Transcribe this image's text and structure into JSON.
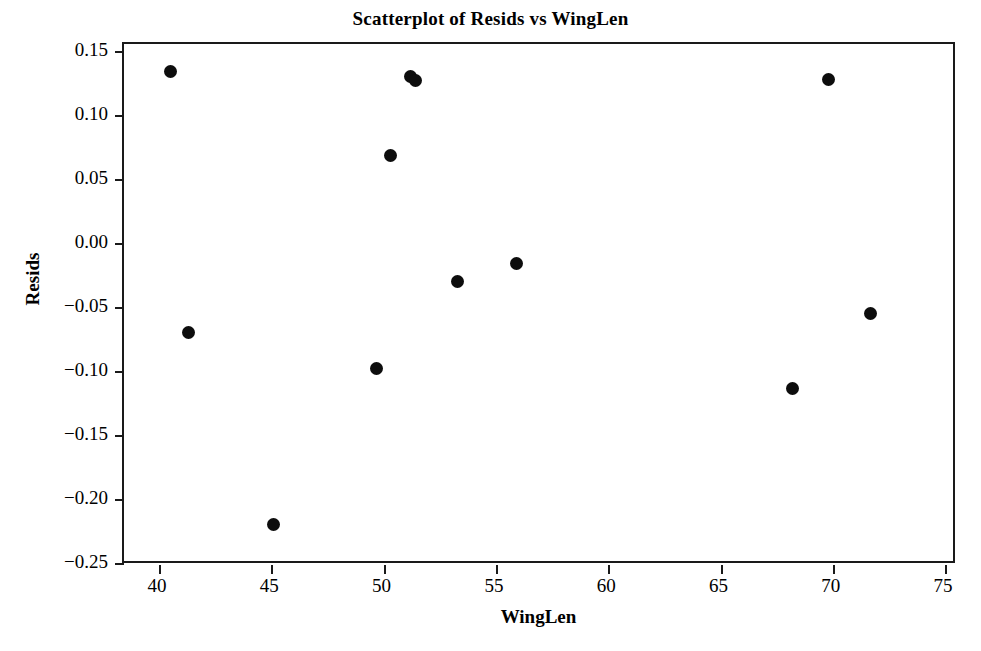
{
  "chart_data": {
    "type": "scatter",
    "title": "Scatterplot of Resids vs WingLen",
    "xlabel": "WingLen",
    "ylabel": "Resids",
    "xlim": [
      38.44,
      75.53
    ],
    "ylim": [
      -0.2516,
      0.1555
    ],
    "xticks": [
      40,
      45,
      50,
      55,
      60,
      65,
      70,
      75
    ],
    "xtick_labels": [
      "40",
      "45",
      "50",
      "55",
      "60",
      "65",
      "70",
      "75"
    ],
    "yticks": [
      0.15,
      0.1,
      0.05,
      0.0,
      -0.05,
      -0.1,
      -0.15,
      -0.2,
      -0.25
    ],
    "ytick_labels": [
      "0.15",
      "0.10",
      "0.05",
      "0.00",
      "−0.05",
      "−0.10",
      "−0.15",
      "−0.20",
      "−0.25"
    ],
    "grid": false,
    "legend": null,
    "marker": "filled-circle",
    "marker_color": "#0d0d0d",
    "frame_color": "#1a1a1a",
    "background": "#ffffff",
    "x": [
      40.5,
      41.3,
      45.1,
      49.7,
      50.3,
      51.2,
      51.4,
      53.3,
      55.9,
      68.2,
      69.8,
      71.7
    ],
    "y": [
      0.134,
      -0.07,
      -0.22,
      -0.098,
      0.068,
      0.13,
      0.127,
      -0.03,
      -0.016,
      -0.114,
      0.128,
      -0.055
    ],
    "points": [
      {
        "x": 40.5,
        "y": 0.134
      },
      {
        "x": 41.3,
        "y": -0.07
      },
      {
        "x": 45.1,
        "y": -0.22
      },
      {
        "x": 49.7,
        "y": -0.098
      },
      {
        "x": 50.3,
        "y": 0.068
      },
      {
        "x": 51.2,
        "y": 0.13
      },
      {
        "x": 51.4,
        "y": 0.127
      },
      {
        "x": 53.3,
        "y": -0.03
      },
      {
        "x": 55.9,
        "y": -0.016
      },
      {
        "x": 68.2,
        "y": -0.114
      },
      {
        "x": 69.8,
        "y": 0.128
      },
      {
        "x": 71.7,
        "y": -0.055
      }
    ]
  }
}
